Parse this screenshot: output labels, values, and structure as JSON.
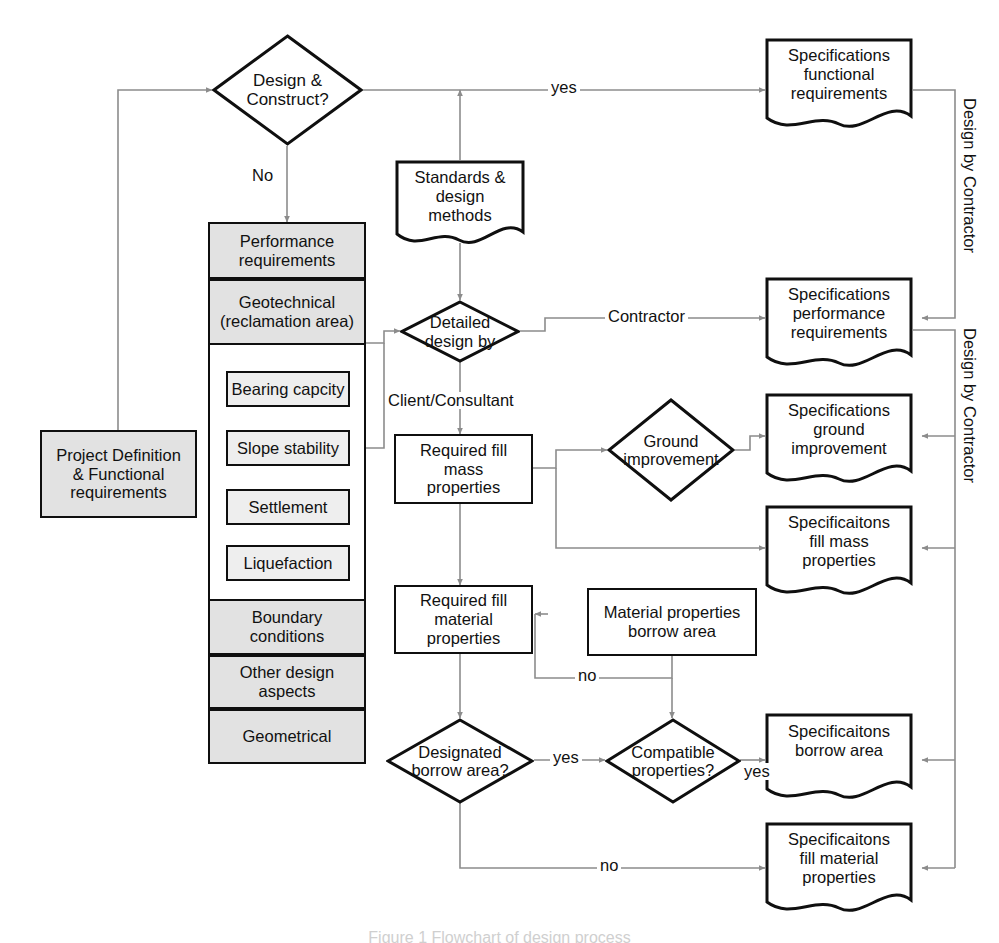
{
  "figure": {
    "caption": "Figure 1 Flowchart of design process",
    "line_color": "#8c8c8c",
    "node_border_color": "#0f0f0f",
    "shaded_fill": "#e2e2e2",
    "background": "#ffffff"
  },
  "nodes": {
    "project_definition": {
      "label": "Project Definition\n& Functional\nrequirements",
      "shape": "rect",
      "shaded": true
    },
    "design_construct": {
      "label": "Design &\nConstruct?",
      "shape": "diamond"
    },
    "standards": {
      "label": "Standards &\ndesign\nmethods",
      "shape": "document"
    },
    "detailed_design": {
      "label": "Detailed\ndesign by",
      "shape": "diamond"
    },
    "required_fill_mass": {
      "label": "Required fill\nmass\nproperties",
      "shape": "rect"
    },
    "required_fill_material": {
      "label": "Required fill\nmaterial\nproperties",
      "shape": "rect"
    },
    "material_properties_borrow": {
      "label": "Material properties\nborrow area",
      "shape": "rect"
    },
    "ground_improvement": {
      "label": "Ground\nimprovement",
      "shape": "diamond"
    },
    "designated_borrow": {
      "label": "Designated\nborrow area?",
      "shape": "diamond"
    },
    "compatible_properties": {
      "label": "Compatible\nproperties?",
      "shape": "diamond"
    },
    "spec_functional": {
      "label": "Specifications\nfunctional\nrequirements",
      "shape": "document"
    },
    "spec_performance": {
      "label": "Specifications\nperformance\nrequirements",
      "shape": "document"
    },
    "spec_ground_improvement": {
      "label": "Specifications\nground\nimprovement",
      "shape": "document"
    },
    "spec_fill_mass": {
      "label": "Specificaitons\nfill mass\nproperties",
      "shape": "document"
    },
    "spec_borrow_area": {
      "label": "Specificaitons\nborrow area",
      "shape": "document"
    },
    "spec_fill_material": {
      "label": "Specificaitons\nfill material\nproperties",
      "shape": "document"
    }
  },
  "requirements_stack": {
    "header_cells": [
      {
        "label": "Performance\nrequirements",
        "shaded": true
      },
      {
        "label": "Geotechnical\n(reclamation area)",
        "shaded": true
      }
    ],
    "inner_items": [
      {
        "label": "Bearing capcity"
      },
      {
        "label": "Slope stability"
      },
      {
        "label": "Settlement"
      },
      {
        "label": "Liquefaction"
      }
    ],
    "footer_cells": [
      {
        "label": "Boundary\nconditions",
        "shaded": true
      },
      {
        "label": "Other design\naspects",
        "shaded": true
      },
      {
        "label": "Geometrical",
        "shaded": true
      }
    ]
  },
  "edge_labels": {
    "design_construct_yes": "yes",
    "design_construct_no": "No",
    "detailed_design_contractor": "Contractor",
    "detailed_design_client": "Client/Consultant",
    "material_no": "no",
    "designated_borrow_yes": "yes",
    "designated_borrow_no": "no",
    "compatible_yes": "yes"
  },
  "side_brackets": [
    {
      "label": "Design by Contractor"
    },
    {
      "label": "Design by Contractor"
    }
  ]
}
